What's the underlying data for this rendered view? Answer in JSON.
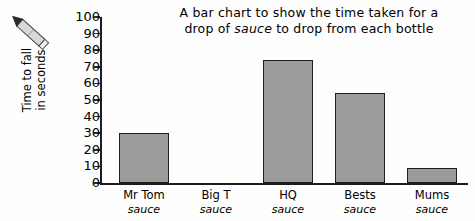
{
  "chart_data": {
    "type": "bar",
    "title": "A bar chart to show the time taken for a drop of sauce to drop from each bottle",
    "title_line1": "A bar chart to show the time taken for a",
    "title_line2_a": "drop of ",
    "title_line2_italic": "sauce",
    "title_line2_b": " to drop from each bottle",
    "categories": [
      "Mr Tom sauce",
      "Big T sauce",
      "HQ sauce",
      "Bests sauce",
      "Mums sauce"
    ],
    "category_brands": [
      "Mr Tom",
      "Big T",
      "HQ",
      "Bests",
      "Mums"
    ],
    "category_suffix": "sauce",
    "values": [
      30,
      0,
      74,
      54,
      9
    ],
    "xlabel": "",
    "ylabel": "Time to fall in seconds",
    "ylabel_line1": "Time to fall",
    "ylabel_line2": "in seconds",
    "ylim": [
      0,
      100
    ],
    "ytick_step": 10,
    "yticks": [
      0,
      10,
      20,
      30,
      40,
      50,
      60,
      70,
      80,
      90,
      100
    ],
    "ytick_labels": [
      "0",
      "10",
      "20",
      "30",
      "40",
      "50",
      "60",
      "70",
      "80",
      "90",
      "100"
    ],
    "grid": false,
    "legend": false,
    "bar_color": "#9b9b9b",
    "bar_border_color": "#1f1f1f",
    "axis_color": "#1d1d1d",
    "background_color": "#fefefe"
  },
  "decoration": {
    "pencil_icon_name": "pencil-icon"
  }
}
